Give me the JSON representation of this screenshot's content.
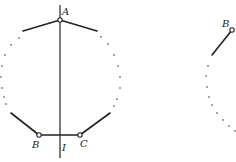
{
  "diagram": {
    "colors": {
      "stroke": "#222222",
      "background": "#ffffff"
    },
    "left_figure": {
      "labels": {
        "A": "A",
        "B": "B",
        "C": "C",
        "I": "I"
      },
      "points": {
        "A": [
          60,
          20
        ],
        "B": [
          39,
          135
        ],
        "C": [
          80,
          135
        ]
      },
      "axis_line": {
        "x": 60,
        "y1": 5,
        "y2": 158
      },
      "segments": [
        [
          [
            60,
            20
          ],
          [
            23,
            31
          ]
        ],
        [
          [
            60,
            20
          ],
          [
            97,
            31
          ]
        ],
        [
          [
            11,
            113
          ],
          [
            39,
            135
          ]
        ],
        [
          [
            39,
            135
          ],
          [
            80,
            135
          ]
        ],
        [
          [
            80,
            135
          ],
          [
            110,
            113
          ]
        ]
      ],
      "dots_left": [
        [
          19,
          38
        ],
        [
          11,
          45
        ],
        [
          5,
          55
        ],
        [
          2,
          66
        ],
        [
          1,
          77
        ],
        [
          2,
          88
        ],
        [
          4,
          97
        ],
        [
          6,
          104
        ]
      ],
      "dots_right": [
        [
          101,
          37
        ],
        [
          108,
          44
        ],
        [
          114,
          55
        ],
        [
          118,
          66
        ],
        [
          120,
          77
        ],
        [
          120,
          88
        ],
        [
          117,
          99
        ],
        [
          114,
          106
        ]
      ]
    },
    "right_figure": {
      "labels": {
        "B": "B"
      },
      "points": {
        "B": [
          232,
          30
        ]
      },
      "segments": [
        [
          [
            232,
            30
          ],
          [
            212,
            55
          ]
        ]
      ],
      "dots": [
        [
          208,
          66
        ],
        [
          206,
          76
        ],
        [
          207,
          87
        ],
        [
          209,
          97
        ],
        [
          212,
          105
        ],
        [
          217,
          113
        ],
        [
          223,
          120
        ],
        [
          229,
          126
        ],
        [
          235,
          131
        ]
      ]
    }
  }
}
